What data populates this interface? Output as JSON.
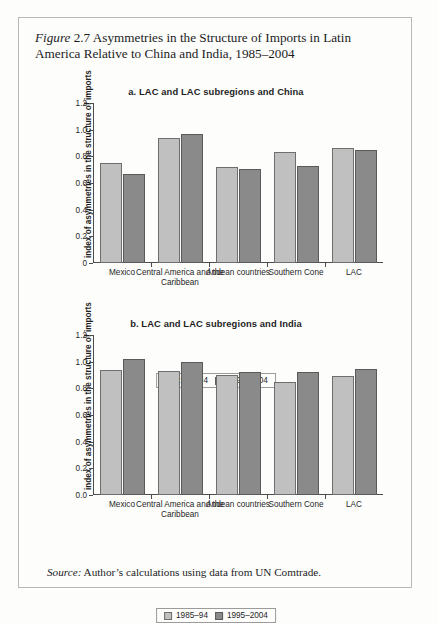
{
  "figure": {
    "label": "Figure",
    "number": "2.7",
    "caption": "Asymmetries in the Structure of Imports in Latin America Relative to China and India, 1985–2004"
  },
  "source": {
    "label": "Source:",
    "text": "Author’s calculations using data from UN Comtrade."
  },
  "legend": {
    "series": [
      {
        "name": "1985–94",
        "color": "#c0c0c0"
      },
      {
        "name": "1995–2004",
        "color": "#8a8a8a"
      }
    ]
  },
  "chart_data": [
    {
      "type": "bar",
      "id": "panel-a",
      "title": "a. LAC and LAC subregions and China",
      "xlabel": "",
      "ylabel": "index of asymmetries in the structure of imports",
      "ylim": [
        0,
        1.2
      ],
      "yticks": [
        "0",
        "0.2",
        "0.4",
        "0.6",
        "0.8",
        "1.0",
        "1.2"
      ],
      "ytick_values": [
        0,
        0.2,
        0.4,
        0.6,
        0.8,
        1.0,
        1.2
      ],
      "grid": false,
      "legend_position": "bottom-center",
      "categories": [
        "Mexico",
        "Central America and the Caribbean",
        "Andean countries",
        "Southern Cone",
        "LAC"
      ],
      "series": [
        {
          "name": "1985–94",
          "values": [
            0.75,
            0.94,
            0.72,
            0.83,
            0.86
          ]
        },
        {
          "name": "1995–2004",
          "values": [
            0.665,
            0.97,
            0.705,
            0.73,
            0.845
          ]
        }
      ]
    },
    {
      "type": "bar",
      "id": "panel-b",
      "title": "b. LAC and LAC subregions and India",
      "xlabel": "",
      "ylabel": "index of asymmetries in the structure of imports",
      "ylim": [
        0,
        1.2
      ],
      "yticks": [
        "0.0",
        "0.2",
        "0.4",
        "0.6",
        "0.8",
        "1.0",
        "1.2"
      ],
      "ytick_values": [
        0,
        0.2,
        0.4,
        0.6,
        0.8,
        1.0,
        1.2
      ],
      "grid": false,
      "legend_position": "bottom-center",
      "categories": [
        "Mexico",
        "Central America and the Caribbean",
        "Andean countries",
        "Southern Cone",
        "LAC"
      ],
      "series": [
        {
          "name": "1985–94",
          "values": [
            0.94,
            0.93,
            0.9,
            0.845,
            0.895
          ]
        },
        {
          "name": "1995–2004",
          "values": [
            1.02,
            0.995,
            0.925,
            0.925,
            0.945
          ]
        }
      ]
    }
  ]
}
